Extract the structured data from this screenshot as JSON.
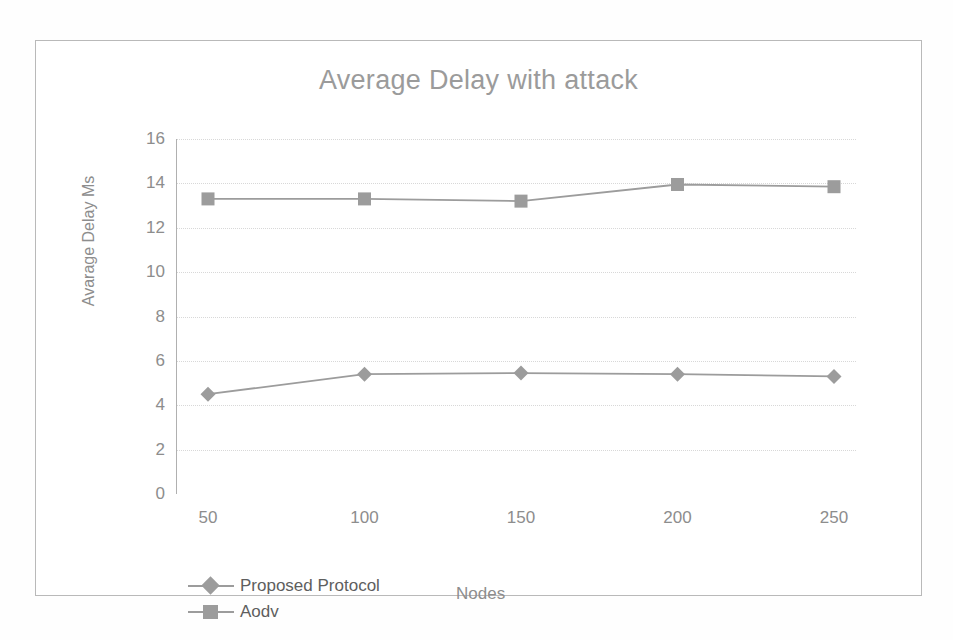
{
  "chart_data": {
    "type": "line",
    "title": "Average Delay with attack",
    "xlabel": "Nodes",
    "ylabel": "Avarage Delay Ms",
    "categories": [
      "50",
      "100",
      "150",
      "200",
      "250"
    ],
    "yticks": [
      "0",
      "2",
      "4",
      "6",
      "8",
      "10",
      "12",
      "14",
      "16"
    ],
    "ylim": [
      0,
      16
    ],
    "grid": true,
    "legend_position": "bottom-left",
    "series": [
      {
        "name": "Proposed Protocol",
        "marker": "diamond",
        "color": "#9c9c9c",
        "values": [
          4.5,
          5.4,
          5.45,
          5.4,
          5.3
        ]
      },
      {
        "name": "Aodv",
        "marker": "square",
        "color": "#9c9c9c",
        "values": [
          13.3,
          13.3,
          13.2,
          13.95,
          13.85
        ]
      }
    ]
  },
  "figure": {
    "caption": ""
  },
  "colors": {
    "frame": "#b9b9b9",
    "text": "#8d8d8d",
    "title": "#9b9b9b",
    "gridline": "#d8d8d8",
    "series": "#9c9c9c"
  }
}
